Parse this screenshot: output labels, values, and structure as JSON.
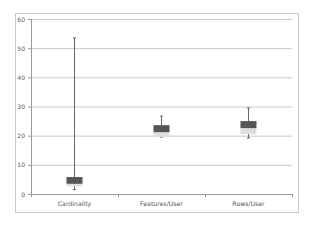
{
  "chart_data": {
    "type": "box",
    "title": "",
    "xlabel": "",
    "ylabel": "",
    "ylim": [
      0,
      60
    ],
    "yticks": [
      0,
      10,
      20,
      30,
      40,
      50,
      60
    ],
    "grid": true,
    "legend": null,
    "categories": [
      "Cardinality",
      "Features/User",
      "Rows/User"
    ],
    "series": [
      {
        "name": "Cardinality",
        "min": 1.5,
        "q1": 2.7,
        "median": 3.5,
        "q3": 5.8,
        "max": 53.5
      },
      {
        "name": "Features/User",
        "min": 19.5,
        "q1": 19.5,
        "median": 21.2,
        "q3": 23.6,
        "max": 26.7
      },
      {
        "name": "Rows/User",
        "min": 19.2,
        "q1": 20.5,
        "median": 22.6,
        "q3": 25.0,
        "max": 29.5
      }
    ],
    "colors": {
      "upper_box": "#555555",
      "lower_box": "#dedede",
      "whisker": "#666666",
      "grid": "#c8c8c8",
      "axis": "#999999"
    }
  }
}
